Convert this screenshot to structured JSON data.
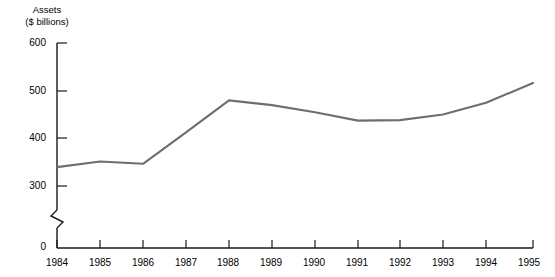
{
  "chart_data": {
    "type": "line",
    "title": "",
    "xlabel": "",
    "ylabel": "Assets ($ billions)",
    "ylabel_line1": "Assets",
    "ylabel_line2": "($ billions)",
    "categories": [
      "1984",
      "1985",
      "1986",
      "1987",
      "1988",
      "1989",
      "1990",
      "1991",
      "1992",
      "1993",
      "1994",
      "1995"
    ],
    "values": [
      338,
      350,
      345,
      412,
      480,
      470,
      455,
      437,
      438,
      450,
      475,
      517
    ],
    "series": [
      {
        "name": "Assets",
        "color": "#6e6e6e",
        "values": [
          338,
          350,
          345,
          412,
          480,
          470,
          455,
          437,
          438,
          450,
          475,
          517
        ]
      }
    ],
    "ytick_labels": [
      "600",
      "500",
      "400",
      "300",
      "0"
    ],
    "ytick_values": [
      600,
      500,
      400,
      300,
      0
    ],
    "ylim": [
      0,
      600
    ],
    "xlim": [
      "1984",
      "1995"
    ],
    "axis_break": true,
    "axis_break_between": [
      0,
      300
    ],
    "grid": false,
    "legend": "none",
    "line_color": "#6e6e6e",
    "axis_color": "#1a1a1a"
  }
}
